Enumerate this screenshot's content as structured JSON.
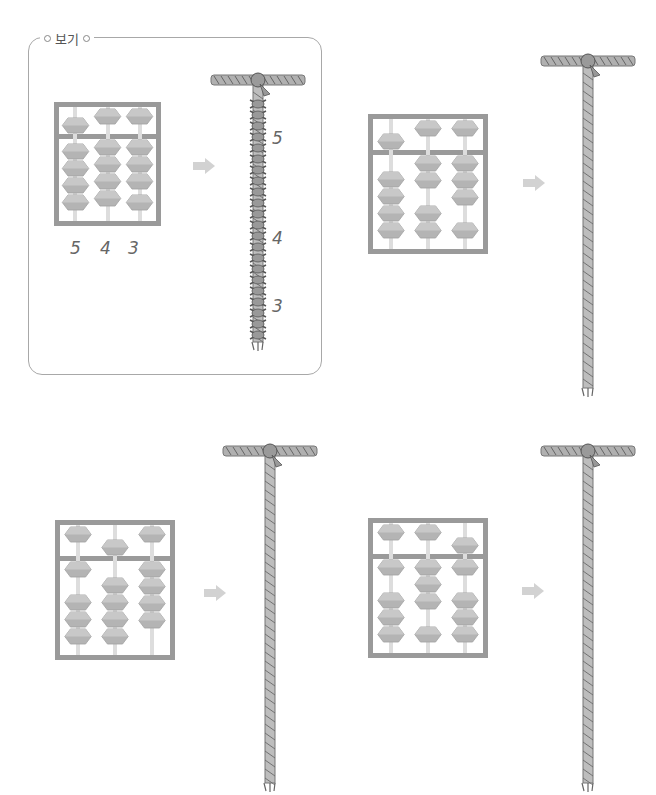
{
  "instruction_cutoff": "(partially visible instruction text, cut off at top)",
  "example_box": {
    "label": "보기",
    "abacus_value": [
      5,
      4,
      3
    ],
    "digit_labels": [
      "5",
      "4",
      "3"
    ],
    "rope_labels": [
      "5",
      "4",
      "3"
    ]
  },
  "problems": [
    {
      "id": "problem-1",
      "abacus_value": [
        5,
        2,
        3
      ]
    },
    {
      "id": "problem-2",
      "abacus_value": [
        1,
        5,
        4
      ]
    },
    {
      "id": "problem-3",
      "abacus_value": [
        1,
        3,
        6
      ]
    }
  ],
  "colors": {
    "frame": "#9a9a9a",
    "bead": "#b4b4b4",
    "rope": "#8a8a8a",
    "arrow": "#d2d2d2",
    "box_border": "#a8a8a8"
  },
  "icons": {
    "arrow": "right-arrow-icon",
    "rope": "knotted-rope-icon"
  }
}
